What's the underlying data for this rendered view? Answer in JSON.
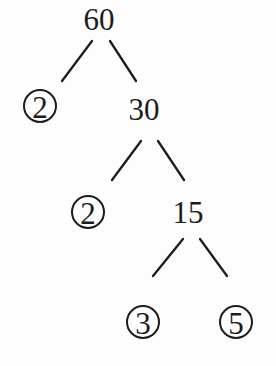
{
  "diagram": {
    "type": "factor-tree",
    "root": "60",
    "nodes": [
      {
        "id": "n60",
        "label": "60",
        "circled": false,
        "x": 99,
        "y": 18
      },
      {
        "id": "n2a",
        "label": "2",
        "circled": true,
        "x": 40,
        "y": 106
      },
      {
        "id": "n30",
        "label": "30",
        "circled": false,
        "x": 144,
        "y": 108
      },
      {
        "id": "n2b",
        "label": "2",
        "circled": true,
        "x": 88,
        "y": 212
      },
      {
        "id": "n15",
        "label": "15",
        "circled": false,
        "x": 188,
        "y": 211
      },
      {
        "id": "n3",
        "label": "3",
        "circled": true,
        "x": 143,
        "y": 322
      },
      {
        "id": "n5",
        "label": "5",
        "circled": true,
        "x": 236,
        "y": 322
      }
    ],
    "edges": [
      {
        "from": "n60",
        "to": "n2a",
        "x1": 92,
        "y1": 41,
        "x2": 62,
        "y2": 81
      },
      {
        "from": "n60",
        "to": "n30",
        "x1": 110,
        "y1": 41,
        "x2": 136,
        "y2": 81
      },
      {
        "from": "n30",
        "to": "n2b",
        "x1": 141,
        "y1": 141,
        "x2": 112,
        "y2": 180
      },
      {
        "from": "n30",
        "to": "n15",
        "x1": 158,
        "y1": 141,
        "x2": 184,
        "y2": 180
      },
      {
        "from": "n15",
        "to": "n3",
        "x1": 183,
        "y1": 239,
        "x2": 153,
        "y2": 276
      },
      {
        "from": "n15",
        "to": "n5",
        "x1": 200,
        "y1": 239,
        "x2": 227,
        "y2": 276
      }
    ],
    "prime_factors": [
      "2",
      "2",
      "3",
      "5"
    ],
    "circle_radius": 16,
    "colors": {
      "ink": "#1c1c1c",
      "background": "#fdfdfd"
    }
  }
}
